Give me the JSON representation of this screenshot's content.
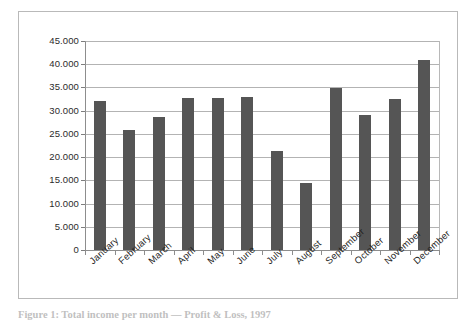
{
  "figure": {
    "caption": "Figure 1: Total income per month — Profit & Loss, 1997"
  },
  "chart_data": {
    "type": "bar",
    "title": "",
    "subtitle": "",
    "xlabel": "",
    "ylabel": "",
    "grid": true,
    "legend": "none",
    "ylim": [
      0,
      45000
    ],
    "ytick_step": 5000,
    "ytick_labels": [
      "45.000",
      "40.000",
      "35.000",
      "30.000",
      "25.000",
      "20.000",
      "15.000",
      "10.000",
      "5.000",
      "0"
    ],
    "ytick_values": [
      45000,
      40000,
      35000,
      30000,
      25000,
      20000,
      15000,
      10000,
      5000,
      0
    ],
    "categories": [
      "January",
      "February",
      "March",
      "April",
      "May",
      "June",
      "July",
      "August",
      "September",
      "October",
      "November",
      "December"
    ],
    "values": [
      32000,
      25800,
      28700,
      32800,
      32800,
      33000,
      21400,
      14400,
      34800,
      29000,
      32500,
      41000
    ],
    "bar_color": "#555555",
    "grid_color": "#9a9a9a",
    "axis_color": "#8d8d8d"
  }
}
